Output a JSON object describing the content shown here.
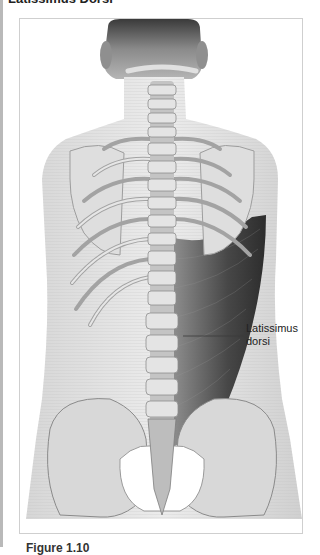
{
  "page": {
    "section_title": "Latissimus Dorsi",
    "caption": "Figure 1.10"
  },
  "figure": {
    "labels": [
      {
        "text_line1": "Latissimus",
        "text_line2": "dorsi",
        "target": "latissimus-dorsi-muscle"
      }
    ],
    "colors": {
      "bone": "#d9d9d9",
      "skin": "#c8c8c8",
      "muscle_dark": "#2b2b2b",
      "frame_border": "#cfcfcf"
    }
  }
}
